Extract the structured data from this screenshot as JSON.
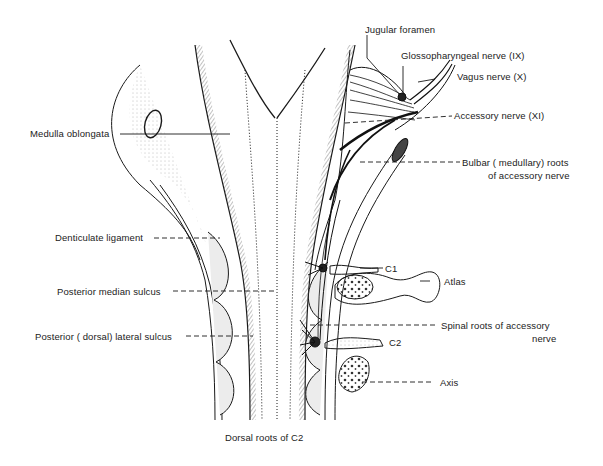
{
  "diagram": {
    "labels": {
      "jugular_foramen": "Jugular foramen",
      "glossopharyngeal": "Glossopharyngeal nerve (IX)",
      "vagus": "Vagus nerve (X)",
      "accessory": "Accessory nerve (XI)",
      "bulbar_roots_1": "Bulbar ( medullary) roots",
      "bulbar_roots_2": "of accessory nerve",
      "medulla": "Medulla oblongata",
      "denticulate": "Denticulate ligament",
      "posterior_median": "Posterior median sulcus",
      "posterior_lateral": "Posterior ( dorsal) lateral sulcus",
      "c1": "C1",
      "atlas": "Atlas",
      "spinal_roots_1": "Spinal roots of accessory",
      "spinal_roots_2": "nerve",
      "c2": "C2",
      "axis": "Axis",
      "dorsal_roots_c2": "Dorsal roots of C2"
    },
    "colors": {
      "ink": "#1a1a1a",
      "background": "#ffffff"
    }
  }
}
